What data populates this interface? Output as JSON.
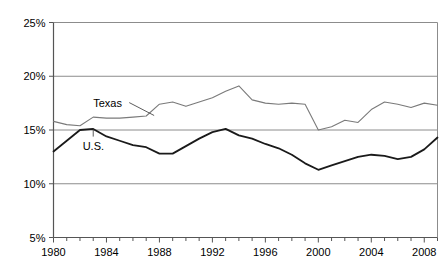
{
  "chart_data": {
    "type": "line",
    "title": "",
    "subtitle": "",
    "xlabel": "",
    "ylabel": "",
    "xlim": [
      1980,
      2009
    ],
    "ylim": [
      5,
      25
    ],
    "yticks": [
      5,
      10,
      15,
      20,
      25
    ],
    "ytick_labels": [
      "5%",
      "10%",
      "15%",
      "20%",
      "25%"
    ],
    "xticks": [
      1980,
      1981,
      1982,
      1983,
      1984,
      1985,
      1986,
      1987,
      1988,
      1989,
      1990,
      1991,
      1992,
      1993,
      1994,
      1995,
      1996,
      1997,
      1998,
      1999,
      2000,
      2001,
      2002,
      2003,
      2004,
      2005,
      2006,
      2007,
      2008,
      2009
    ],
    "xtick_labels_shown": [
      "1980",
      "1984",
      "1988",
      "1992",
      "1996",
      "2000",
      "2004",
      "2008"
    ],
    "grid": "horizontal",
    "legend_position": "inline-annotations",
    "x": [
      1980,
      1981,
      1982,
      1983,
      1984,
      1985,
      1986,
      1987,
      1988,
      1989,
      1990,
      1991,
      1992,
      1993,
      1994,
      1995,
      1996,
      1997,
      1998,
      1999,
      2000,
      2001,
      2002,
      2003,
      2004,
      2005,
      2006,
      2007,
      2008,
      2009
    ],
    "series": [
      {
        "name": "Texas",
        "color": "#7a7a7a",
        "width": 1.1,
        "values": [
          15.8,
          15.5,
          15.4,
          16.2,
          16.1,
          16.1,
          16.2,
          16.3,
          17.4,
          17.6,
          17.2,
          17.6,
          18.0,
          18.6,
          19.1,
          17.8,
          17.5,
          17.4,
          17.5,
          17.4,
          15.0,
          15.3,
          15.9,
          15.7,
          16.9,
          17.6,
          17.4,
          17.1,
          17.5,
          17.3
        ]
      },
      {
        "name": "U.S.",
        "color": "#1a1a1a",
        "width": 1.8,
        "values": [
          13.0,
          14.0,
          15.0,
          15.1,
          14.4,
          14.0,
          13.6,
          13.4,
          12.8,
          12.8,
          13.5,
          14.2,
          14.8,
          15.1,
          14.5,
          14.2,
          13.7,
          13.3,
          12.7,
          11.9,
          11.3,
          11.7,
          12.1,
          12.5,
          12.7,
          12.6,
          12.3,
          12.5,
          13.2,
          14.3
        ]
      }
    ],
    "annotations": [
      {
        "label": "Texas",
        "x_text": 1983.0,
        "y_text": 17.55,
        "leader_to_x": 1987.6,
        "leader_to_y": 16.35
      },
      {
        "label": "U.S.",
        "x_text": 1982.2,
        "y_text": 13.55,
        "leader_to_x": 1983.0,
        "leader_to_y": 15.05
      }
    ]
  },
  "axes": {
    "y_tick_labels": [
      "25%",
      "20%",
      "15%",
      "10%",
      "5%"
    ],
    "x_tick_labels": [
      "1980",
      "1984",
      "1988",
      "1992",
      "1996",
      "2000",
      "2004",
      "2008"
    ]
  }
}
